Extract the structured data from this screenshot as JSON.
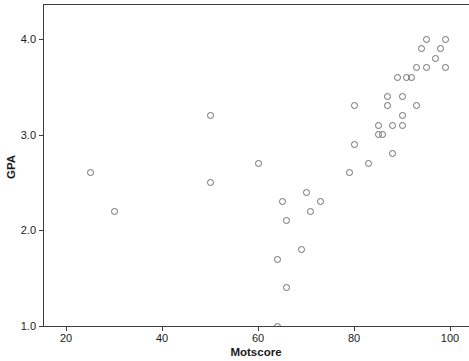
{
  "chart_data": {
    "type": "scatter",
    "title": "",
    "xlabel": "Motscore",
    "ylabel": "GPA",
    "x_ticks": [
      20,
      40,
      60,
      80,
      100
    ],
    "y_ticks": [
      {
        "v": 4.0,
        "label": "4.0"
      },
      {
        "v": 3.0,
        "label": "3.0"
      },
      {
        "v": 2.0,
        "label": "2.0"
      },
      {
        "v": 1.0,
        "label": "1.0"
      }
    ],
    "xlim": [
      15,
      104
    ],
    "ylim": [
      1.0,
      4.4
    ],
    "grid": false,
    "legend": "none",
    "marker": "open-circle",
    "points": [
      [
        25,
        2.6
      ],
      [
        30,
        2.2
      ],
      [
        50,
        3.2
      ],
      [
        50,
        2.5
      ],
      [
        60,
        2.7
      ],
      [
        64,
        1.0
      ],
      [
        64,
        1.7
      ],
      [
        66,
        1.4
      ],
      [
        69,
        1.8
      ],
      [
        66,
        2.1
      ],
      [
        65,
        2.3
      ],
      [
        71,
        2.2
      ],
      [
        73,
        2.3
      ],
      [
        70,
        2.4
      ],
      [
        79,
        2.6
      ],
      [
        80,
        2.9
      ],
      [
        83,
        2.7
      ],
      [
        80,
        3.3
      ],
      [
        85,
        3.0
      ],
      [
        86,
        3.0
      ],
      [
        85,
        3.1
      ],
      [
        88,
        3.1
      ],
      [
        90,
        3.1
      ],
      [
        88,
        2.8
      ],
      [
        87,
        3.3
      ],
      [
        93,
        3.3
      ],
      [
        87,
        3.4
      ],
      [
        90,
        3.4
      ],
      [
        90,
        3.2
      ],
      [
        89,
        3.6
      ],
      [
        91,
        3.6
      ],
      [
        92,
        3.6
      ],
      [
        93,
        3.7
      ],
      [
        95,
        3.7
      ],
      [
        99,
        3.7
      ],
      [
        97,
        3.8
      ],
      [
        94,
        3.9
      ],
      [
        98,
        3.9
      ],
      [
        95,
        4.0
      ],
      [
        99,
        4.0
      ]
    ]
  },
  "colors": {
    "axis": "#3d3d3d",
    "marker_outline": "#6e6e6e",
    "text": "#1a1a1a",
    "background": "#ffffff"
  }
}
